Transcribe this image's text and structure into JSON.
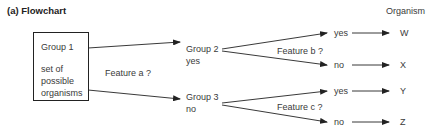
{
  "title": "(a) Flowchart",
  "column_header": "Organism",
  "root": {
    "label": "Group 1",
    "description": [
      "set of",
      "possible",
      "organisms"
    ]
  },
  "questions": {
    "a": "Feature a ?",
    "b": "Feature b ?",
    "c": "Feature c ?"
  },
  "group2": {
    "label": "Group 2",
    "answer": "yes"
  },
  "group3": {
    "label": "Group 3",
    "answer": "no"
  },
  "leaves": [
    {
      "answer": "yes",
      "organism": "W"
    },
    {
      "answer": "no",
      "organism": "X"
    },
    {
      "answer": "yes",
      "organism": "Y"
    },
    {
      "answer": "no",
      "organism": "Z"
    }
  ],
  "colors": {
    "line": "#222222",
    "text": "#3a3a3a"
  }
}
